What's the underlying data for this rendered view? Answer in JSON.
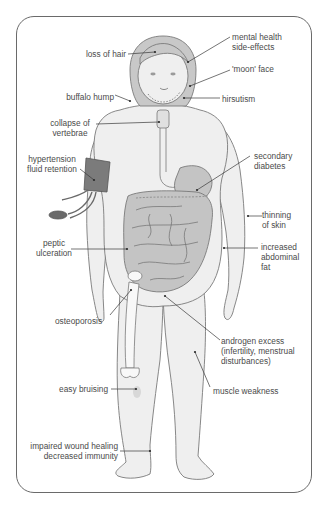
{
  "diagram": {
    "colors": {
      "skin": "#efefef",
      "outline": "#7a7a7a",
      "organs": "#c4c4c4",
      "cuff": "#7b7b7b",
      "text": "#4a4a4a",
      "leader": "#3a3a3a"
    },
    "labels": {
      "loss_of_hair": "loss of hair",
      "mental_health_1": "mental health",
      "mental_health_2": "side-effects",
      "moon_face": "'moon' face",
      "buffalo_hump": "buffalo hump",
      "hirsutism": "hirsutism",
      "collapse_1": "collapse of",
      "collapse_2": "vertebrae",
      "hypertension_1": "hypertension",
      "hypertension_2": "fluid retention",
      "secondary_diabetes_1": "secondary",
      "secondary_diabetes_2": "diabetes",
      "thinning_1": "thinning",
      "thinning_2": "of skin",
      "peptic_1": "peptic",
      "peptic_2": "ulceration",
      "abdominal_1": "increased",
      "abdominal_2": "abdominal",
      "abdominal_3": "fat",
      "osteoporosis": "osteoporosis",
      "androgen_1": "androgen excess",
      "androgen_2": "(infertility, menstrual",
      "androgen_3": "disturbances)",
      "easy_bruising": "easy bruising",
      "muscle_weakness": "muscle weakness",
      "wound_1": "impaired wound healing",
      "wound_2": "decreased immunity"
    }
  }
}
